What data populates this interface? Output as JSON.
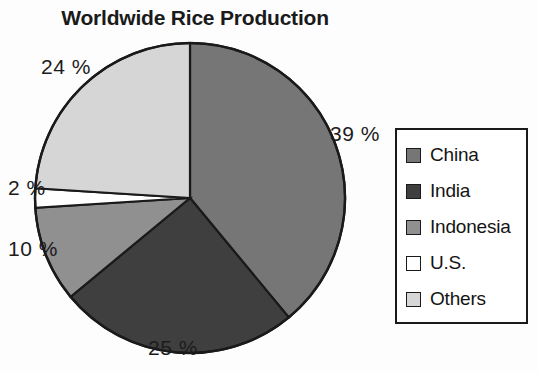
{
  "chart_data": {
    "type": "pie",
    "title": "Worldwide Rice Production",
    "categories": [
      "China",
      "India",
      "Indonesia",
      "U.S.",
      "Others"
    ],
    "values": [
      39,
      25,
      10,
      2,
      24
    ],
    "value_labels": [
      "39 %",
      "25 %",
      "10 %",
      "2 %",
      "24 %"
    ],
    "unit": "%",
    "start_angle_deg": 0,
    "direction": "clockwise",
    "legend_position": "right",
    "grid": false,
    "xlabel": "",
    "ylabel": "",
    "colors": [
      "#767676",
      "#3f3f3f",
      "#909090",
      "#ffffff",
      "#d6d6d6"
    ],
    "outline_color": "#1a1a1a",
    "background": "#fdfdfd"
  },
  "legend": {
    "items": [
      {
        "label": "China",
        "color": "#767676"
      },
      {
        "label": "India",
        "color": "#3f3f3f"
      },
      {
        "label": "Indonesia",
        "color": "#909090"
      },
      {
        "label": "U.S.",
        "color": "#ffffff"
      },
      {
        "label": "Others",
        "color": "#d6d6d6"
      }
    ]
  },
  "labels": {
    "china": "39 %",
    "india": "25 %",
    "indonesia": "10 %",
    "us": "2 %",
    "others": "24 %"
  }
}
